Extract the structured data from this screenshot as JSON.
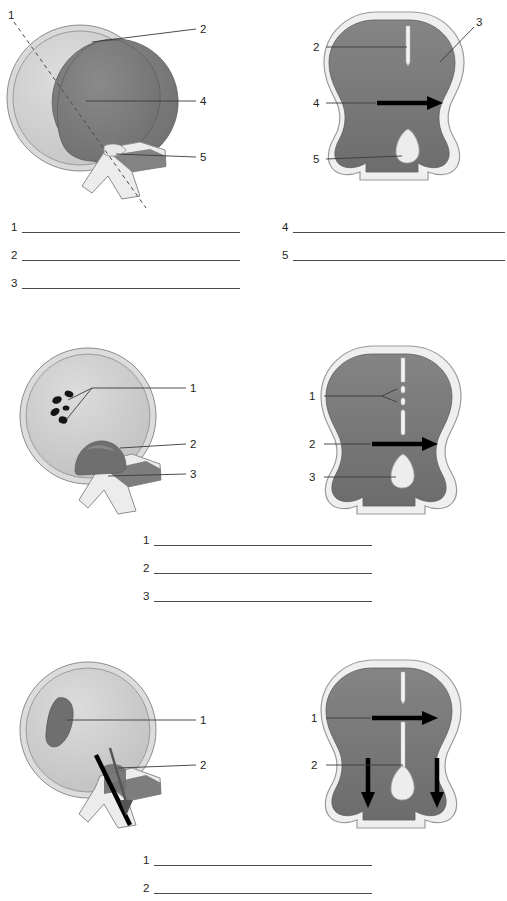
{
  "document": {
    "type": "anatomy-labeling-worksheet",
    "subject": "eye cross-section diagrams",
    "page_width": 507,
    "page_height": 901,
    "background_color": "#ffffff",
    "ink_color": "#231f20"
  },
  "palette": {
    "outer_coat_light": "#d9d9d9",
    "outer_coat_edge": "#9a9a9a",
    "interior_mid_gray": "#bdbdbd",
    "interior_dark_gray": "#7d7d7d",
    "interior_darker_gray": "#6e6e6e",
    "highlight_white": "#f2f2f2",
    "spot_black": "#1a1a1a",
    "arrow_black": "#000000",
    "line_gray": "#4a4a4a",
    "leader_line": "#3a3a3a"
  },
  "figures": [
    {
      "id": "fig-1-left",
      "name": "eye-sagittal-section-normal",
      "view": "side",
      "callouts": [
        {
          "label": "1",
          "x": 8,
          "y": 14,
          "style": "dashed",
          "target": "oblique-section-plane"
        },
        {
          "label": "2",
          "x": 200,
          "y": 27,
          "style": "solid",
          "target": "outer-coat"
        },
        {
          "label": "4",
          "x": 200,
          "y": 100,
          "style": "solid",
          "target": "interior-chamber"
        },
        {
          "label": "5",
          "x": 200,
          "y": 157,
          "style": "solid",
          "target": "optic-nerve-head"
        }
      ]
    },
    {
      "id": "fig-1-right",
      "name": "eye-frontal-section-normal",
      "view": "front",
      "callouts": [
        {
          "label": "2",
          "x": 327,
          "y": 47,
          "style": "solid",
          "target": "upper-fissure"
        },
        {
          "label": "3",
          "x": 492,
          "y": 24,
          "style": "solid",
          "target": "outer-wall"
        },
        {
          "label": "4",
          "x": 327,
          "y": 102,
          "style": "arrow",
          "target": "horizontal-flow"
        },
        {
          "label": "5",
          "x": 327,
          "y": 159,
          "style": "solid",
          "target": "lower-body"
        }
      ]
    },
    {
      "id": "fig-2-left",
      "name": "eye-sagittal-section-with-spots",
      "view": "side",
      "callouts": [
        {
          "label": "1",
          "x": 192,
          "y": 381,
          "style": "solid",
          "target": "dark-deposits"
        },
        {
          "label": "2",
          "x": 192,
          "y": 439,
          "style": "solid",
          "target": "posterior-mass"
        },
        {
          "label": "3",
          "x": 192,
          "y": 470,
          "style": "solid",
          "target": "nerve-stalk"
        }
      ]
    },
    {
      "id": "fig-2-right",
      "name": "eye-frontal-section-with-deposits",
      "view": "front",
      "callouts": [
        {
          "label": "1",
          "x": 311,
          "y": 396,
          "style": "solid",
          "target": "fissure-deposits"
        },
        {
          "label": "2",
          "x": 311,
          "y": 444,
          "style": "arrow",
          "target": "horizontal-flow"
        },
        {
          "label": "3",
          "x": 311,
          "y": 477,
          "style": "solid",
          "target": "lower-body"
        }
      ]
    },
    {
      "id": "fig-3-left",
      "name": "eye-sagittal-section-with-crescent",
      "view": "side",
      "callouts": [
        {
          "label": "1",
          "x": 205,
          "y": 712,
          "style": "solid",
          "target": "crescent-lesion"
        },
        {
          "label": "2",
          "x": 205,
          "y": 760,
          "style": "solid",
          "target": "oblique-bar"
        }
      ]
    },
    {
      "id": "fig-3-right",
      "name": "eye-frontal-section-with-downward-flow",
      "view": "front",
      "callouts": [
        {
          "label": "1",
          "x": 313,
          "y": 718,
          "style": "arrow",
          "target": "horizontal-flow"
        },
        {
          "label": "2",
          "x": 313,
          "y": 765,
          "style": "solid",
          "target": "downward-flow"
        }
      ]
    }
  ],
  "answer_blocks": [
    {
      "id": "block-1-left",
      "name": "answer-lines-row1-left",
      "left": 11,
      "top": 222,
      "line_width": 218,
      "row_gap": 28,
      "items": [
        {
          "number": "1"
        },
        {
          "number": "2"
        },
        {
          "number": "3"
        }
      ]
    },
    {
      "id": "block-1-right",
      "name": "answer-lines-row1-right",
      "left": 282,
      "top": 222,
      "line_width": 212,
      "row_gap": 28,
      "items": [
        {
          "number": "4"
        },
        {
          "number": "5"
        }
      ]
    },
    {
      "id": "block-2",
      "name": "answer-lines-row2",
      "left": 143,
      "top": 535,
      "line_width": 218,
      "row_gap": 28,
      "items": [
        {
          "number": "1"
        },
        {
          "number": "2"
        },
        {
          "number": "3"
        }
      ]
    },
    {
      "id": "block-3",
      "name": "answer-lines-row3",
      "left": 143,
      "top": 855,
      "line_width": 218,
      "row_gap": 28,
      "items": [
        {
          "number": "1"
        },
        {
          "number": "2"
        }
      ]
    }
  ]
}
